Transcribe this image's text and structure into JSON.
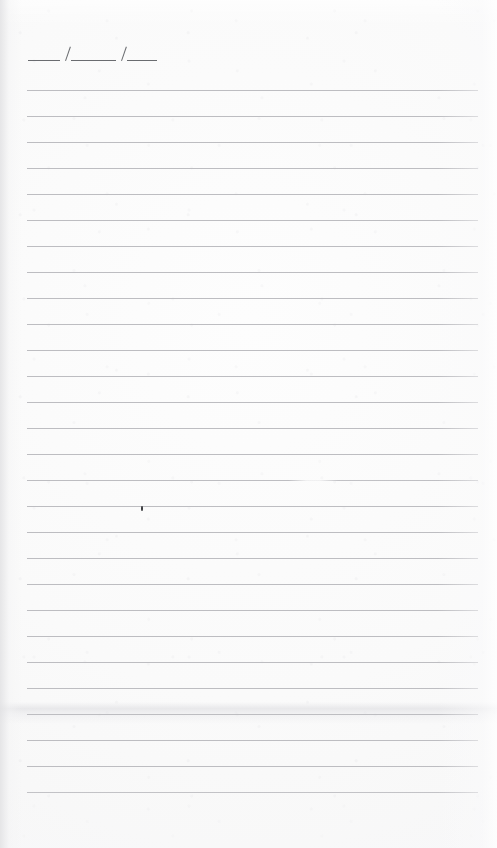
{
  "document": {
    "kind": "lined-notebook-page",
    "width": 497,
    "height": 848,
    "paper_color": "#fbfbfb",
    "rule_color": "#bdbdc1",
    "ink_color": "#6a6c70"
  },
  "date_field": {
    "label": "___/___/___",
    "segments": [
      "___",
      "___",
      "___"
    ],
    "separator": "/",
    "x": 28,
    "y": 60,
    "segment_widths": [
      32,
      45,
      30
    ]
  },
  "rules": {
    "count": 28,
    "first_y": 90,
    "spacing": 26,
    "left_x": 27,
    "right_x": 478,
    "thickness": 1,
    "faded_index": 15
  },
  "artifacts": {
    "ink_dot": {
      "x": 141,
      "y": 506,
      "width": 2,
      "height": 5
    },
    "crease": {
      "y": 702,
      "height": 22
    }
  }
}
